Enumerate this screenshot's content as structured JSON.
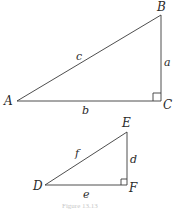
{
  "diagram": {
    "triangles": [
      {
        "name": "ABC",
        "vertices": {
          "A": {
            "label": "A",
            "x": 17,
            "y": 101
          },
          "B": {
            "label": "B",
            "x": 161,
            "y": 15
          },
          "C": {
            "label": "C",
            "x": 161,
            "y": 101
          }
        },
        "sides": {
          "a": "a",
          "b": "b",
          "c": "c"
        },
        "right_angle_at": "C"
      },
      {
        "name": "DEF",
        "vertices": {
          "D": {
            "label": "D",
            "x": 45,
            "y": 185
          },
          "E": {
            "label": "E",
            "x": 127,
            "y": 132
          },
          "F": {
            "label": "F",
            "x": 127,
            "y": 185
          }
        },
        "sides": {
          "d": "d",
          "e": "e",
          "f": "f"
        },
        "right_angle_at": "F"
      }
    ],
    "caption": "Figure 13.13"
  }
}
